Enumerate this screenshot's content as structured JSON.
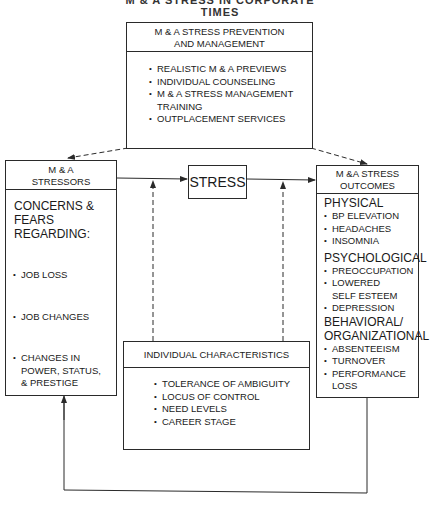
{
  "page_title_clipped": "M & A STRESS IN CORPORATE TIMES",
  "prevention_box": {
    "title": "M & A STRESS PREVENTION AND MANAGEMENT",
    "title_line1": "M & A STRESS PREVENTION",
    "title_line2": "AND MANAGEMENT",
    "items": [
      "REALISTIC M & A PREVIEWS",
      "INDIVIDUAL COUNSELING",
      "M & A STRESS MANAGEMENT TRAINING",
      "OUTPLACEMENT SERVICES"
    ]
  },
  "stressors_box": {
    "title_line1": "M & A",
    "title_line2": "STRESSORS",
    "intro": "CONCERNS & FEARS REGARDING:",
    "items": [
      "JOB LOSS",
      "JOB CHANGES",
      "CHANGES IN POWER, STATUS, & PRESTIGE"
    ]
  },
  "stress_box": {
    "label": "STRESS"
  },
  "outcomes_box": {
    "title_line1": "M &A STRESS",
    "title_line2": "OUTCOMES",
    "groups": [
      {
        "heading": "PHYSICAL",
        "items": [
          "BP ELEVATION",
          "HEADACHES",
          "INSOMNIA"
        ]
      },
      {
        "heading": "PSYCHOLOGICAL",
        "items": [
          "PREOCCUPATION",
          "LOWERED SELF ESTEEM",
          "DEPRESSION"
        ]
      },
      {
        "heading": "BEHAVIORAL/ ORGANIZATIONAL",
        "items": [
          "ABSENTEEISM",
          "TURNOVER",
          "PERFORMANCE LOSS"
        ]
      }
    ]
  },
  "individual_box": {
    "title": "INDIVIDUAL CHARACTERISTICS",
    "items": [
      "TOLERANCE OF AMBIGUITY",
      "LOCUS OF CONTROL",
      "NEED LEVELS",
      "CAREER STAGE"
    ]
  },
  "colors": {
    "line": "#2a2a2a",
    "background": "#ffffff"
  }
}
